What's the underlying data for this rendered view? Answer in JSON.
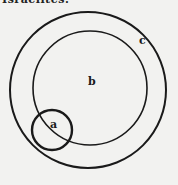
{
  "header": {
    "cut_text": "Israelites."
  },
  "diagram": {
    "type": "nested-circles",
    "stroke_color": "#1a1a1a",
    "background": "#f2f2f0",
    "circles": [
      {
        "label": "c",
        "cx": 88,
        "cy": 90,
        "r": 78,
        "stroke_width": 2
      },
      {
        "label": "b",
        "cx": 90,
        "cy": 88,
        "r": 57,
        "stroke_width": 1.6
      },
      {
        "label": "a",
        "cx": 52,
        "cy": 130,
        "r": 20,
        "stroke_width": 2.4
      }
    ],
    "labels": [
      {
        "text": "c",
        "x": 139,
        "y": 44
      },
      {
        "text": "b",
        "x": 88,
        "y": 85
      },
      {
        "text": "a",
        "x": 50,
        "y": 128
      }
    ]
  }
}
